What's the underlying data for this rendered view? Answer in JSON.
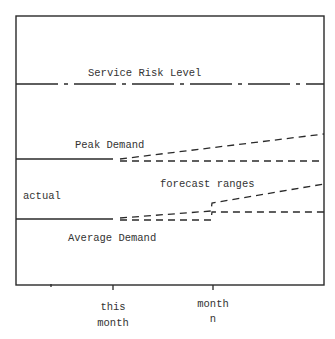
{
  "diagram": {
    "title": "",
    "colors": {
      "ink": "#2a2a2a",
      "background": "#ffffff"
    },
    "frame": {
      "left": 16,
      "top": 16,
      "right": 324,
      "bottom": 285
    },
    "labels": {
      "service_risk": "Service Risk Level",
      "peak": "Peak Demand",
      "actual": "actual",
      "forecast": "forecast ranges",
      "average": "Average Demand"
    },
    "x_axis": {
      "ticks": [
        {
          "x": 113,
          "line1": "this",
          "line2": "month"
        },
        {
          "x": 213,
          "line1": "month",
          "line2": "n"
        }
      ]
    },
    "series": [
      {
        "name": "Service Risk Level",
        "style": "dash-dot",
        "points": [
          [
            16,
            84
          ],
          [
            324,
            84
          ]
        ]
      },
      {
        "name": "Peak Demand actual",
        "style": "solid",
        "points": [
          [
            16,
            159
          ],
          [
            113,
            159
          ]
        ]
      },
      {
        "name": "Peak Demand forecast upper",
        "style": "dashed",
        "points": [
          [
            120,
            159
          ],
          [
            324,
            134
          ]
        ]
      },
      {
        "name": "Peak Demand forecast lower",
        "style": "dashed",
        "points": [
          [
            120,
            161
          ],
          [
            324,
            161
          ]
        ]
      },
      {
        "name": "Average Demand actual",
        "style": "solid",
        "points": [
          [
            16,
            219
          ],
          [
            113,
            219
          ]
        ]
      },
      {
        "name": "Average Demand forecast upper",
        "style": "dashed",
        "points": [
          [
            120,
            218
          ],
          [
            211,
            211
          ],
          [
            212,
            203
          ],
          [
            324,
            184
          ]
        ]
      },
      {
        "name": "Average Demand forecast lower",
        "style": "dashed",
        "points": [
          [
            120,
            220
          ],
          [
            211,
            220
          ],
          [
            212,
            212
          ],
          [
            324,
            212
          ]
        ]
      }
    ]
  }
}
